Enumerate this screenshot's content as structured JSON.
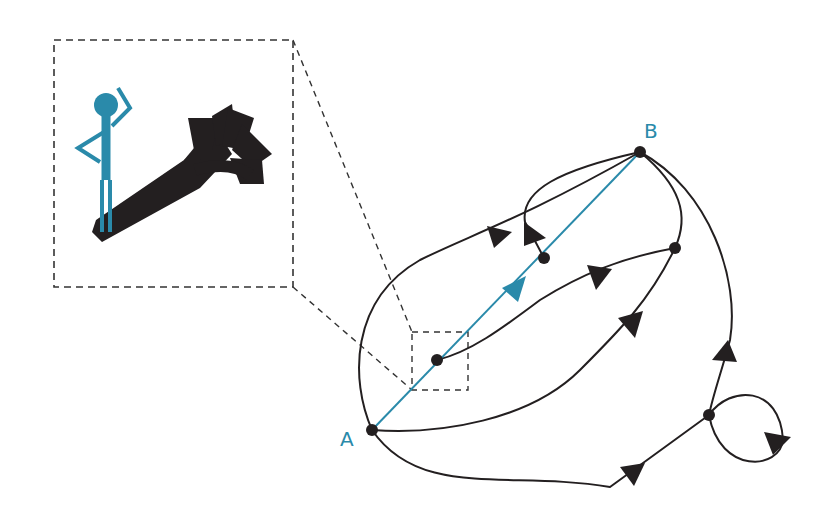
{
  "diagram": {
    "colors": {
      "accent": "#2a8aaa",
      "ink": "#231f20",
      "background": "#ffffff"
    },
    "nodes": [
      {
        "id": "A",
        "label": "A",
        "x": 372,
        "y": 430,
        "labeled": true
      },
      {
        "id": "B",
        "label": "B",
        "x": 640,
        "y": 152,
        "labeled": true
      },
      {
        "id": "n1",
        "label": "",
        "x": 437,
        "y": 360
      },
      {
        "id": "n2",
        "label": "",
        "x": 544,
        "y": 258
      },
      {
        "id": "n3",
        "label": "",
        "x": 675,
        "y": 248
      },
      {
        "id": "n4",
        "label": "",
        "x": 709,
        "y": 415
      }
    ],
    "direct_path": {
      "from": "A",
      "to": "B",
      "color": "#2a8aaa",
      "style": "straight"
    },
    "inset": {
      "description": "Person looking at a fan of diverging arrows",
      "figure_color": "#2a8aaa",
      "arrow_color": "#231f20",
      "border": "dashed"
    },
    "zoom_region": {
      "x": 412,
      "y": 332,
      "width": 56,
      "height": 58
    }
  }
}
